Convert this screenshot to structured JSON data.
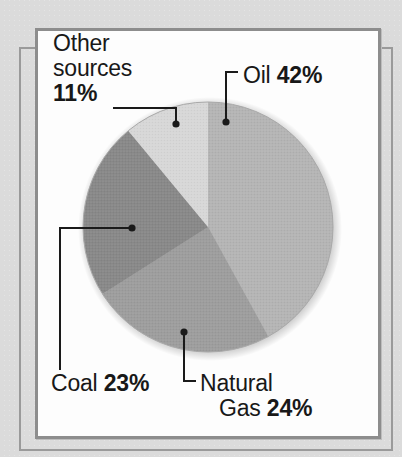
{
  "chart_data": {
    "type": "pie",
    "title": "",
    "subtitle": "",
    "xlabel": "",
    "ylabel": "",
    "legend_position": "callout-labels",
    "grid": false,
    "units": "percent",
    "total": 100,
    "slices": [
      {
        "name": "Oil",
        "label_name": "Oil",
        "value": 42,
        "value_label": "42%",
        "color": "#b4b4b4",
        "start_angle_deg": 0,
        "end_angle_deg": 151.2
      },
      {
        "name": "Natural Gas",
        "label_name_line1": "Natural",
        "label_name_line2": "Gas",
        "value": 24,
        "value_label": "24%",
        "color": "#9d9d9d",
        "start_angle_deg": 151.2,
        "end_angle_deg": 237.6
      },
      {
        "name": "Coal",
        "label_name": "Coal",
        "value": 23,
        "value_label": "23%",
        "color": "#888888",
        "start_angle_deg": 237.6,
        "end_angle_deg": 320.4
      },
      {
        "name": "Other sources",
        "label_name_line1": "Other",
        "label_name_line2": "sources",
        "value": 11,
        "value_label": "11%",
        "color": "#d7d7d7",
        "start_angle_deg": 320.4,
        "end_angle_deg": 360
      }
    ]
  },
  "labels": {
    "other_sources": {
      "line1": "Other",
      "line2": "sources",
      "value": "11%"
    },
    "oil": {
      "name": "Oil",
      "value": "42%"
    },
    "coal": {
      "name": "Coal",
      "value": "23%"
    },
    "natural_gas": {
      "line1": "Natural",
      "line2": "Gas",
      "value": "24%"
    }
  },
  "style": {
    "page_background": "#dbdbdb",
    "panel_background": "#fdfdfd",
    "panel_border": "#8d8d8d",
    "frame_line": "#9a9a9a",
    "text_color": "#181818",
    "leader_line_color": "#1a1a1a"
  }
}
